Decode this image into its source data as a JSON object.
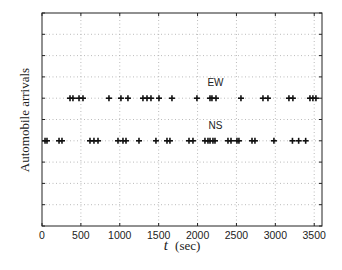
{
  "chart_data": {
    "type": "scatter",
    "title": "",
    "xlabel_var": "t",
    "xlabel_unit": "(sec)",
    "ylabel": "Automobile arrivals",
    "xlim": [
      0,
      3600
    ],
    "ylim": [
      0,
      10
    ],
    "xticks": [
      0,
      500,
      1000,
      1500,
      2000,
      2500,
      3000,
      3500
    ],
    "yticks": [
      0,
      1,
      2,
      3,
      4,
      5,
      6,
      7,
      8,
      9,
      10
    ],
    "ytick_labels_shown": false,
    "grid": true,
    "marker": "+",
    "series": [
      {
        "name": "EW",
        "y": 6,
        "x": [
          360,
          398,
          476,
          527,
          861,
          1015,
          1105,
          1298,
          1350,
          1401,
          1504,
          1671,
          1992,
          2160,
          2185,
          2237,
          2558,
          2841,
          2905,
          3175,
          3226,
          3445,
          3483,
          3522
        ]
      },
      {
        "name": "NS",
        "y": 4,
        "x": [
          39,
          64,
          219,
          257,
          617,
          668,
          720,
          977,
          1041,
          1080,
          1247,
          1465,
          1607,
          1645,
          1890,
          1941,
          2095,
          2134,
          2160,
          2198,
          2224,
          2391,
          2430,
          2507,
          2532,
          2700,
          2738,
          2982,
          3220,
          3300,
          3390
        ]
      }
    ],
    "annotations": [
      {
        "text": "EW",
        "x": 2230,
        "y": 6.75
      },
      {
        "text": "NS",
        "x": 2230,
        "y": 4.75
      }
    ]
  }
}
